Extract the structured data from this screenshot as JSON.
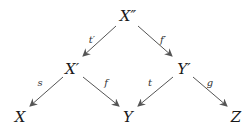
{
  "diagram": {
    "type": "commutative-diagram",
    "line_color": "#555555",
    "nodes": [
      {
        "id": "Xpp",
        "label": "X″",
        "x": 128,
        "y": 16
      },
      {
        "id": "Xp",
        "label": "X′",
        "x": 72,
        "y": 69
      },
      {
        "id": "Yp",
        "label": "Y′",
        "x": 184,
        "y": 69
      },
      {
        "id": "X",
        "label": "X",
        "x": 20,
        "y": 117
      },
      {
        "id": "Y",
        "label": "Y",
        "x": 128,
        "y": 117
      },
      {
        "id": "Z",
        "label": "Z",
        "x": 236,
        "y": 117
      }
    ],
    "edges": [
      {
        "from": "Xpp",
        "to": "Xp",
        "label": "t′",
        "lx": 92,
        "ly": 40,
        "x1": 116,
        "y1": 26,
        "x2": 83,
        "y2": 56
      },
      {
        "from": "Xpp",
        "to": "Yp",
        "label": "f′",
        "lx": 163,
        "ly": 40,
        "x1": 138,
        "y1": 26,
        "x2": 172,
        "y2": 56
      },
      {
        "from": "Xp",
        "to": "X",
        "label": "s",
        "lx": 40,
        "ly": 83,
        "x1": 63,
        "y1": 77,
        "x2": 30,
        "y2": 106
      },
      {
        "from": "Xp",
        "to": "Y",
        "label": "f",
        "lx": 106,
        "ly": 83,
        "x1": 83,
        "y1": 77,
        "x2": 119,
        "y2": 106
      },
      {
        "from": "Yp",
        "to": "Y",
        "label": "t",
        "lx": 150,
        "ly": 83,
        "x1": 173,
        "y1": 77,
        "x2": 138,
        "y2": 106
      },
      {
        "from": "Yp",
        "to": "Z",
        "label": "g",
        "lx": 210,
        "ly": 83,
        "x1": 193,
        "y1": 77,
        "x2": 227,
        "y2": 106
      }
    ]
  }
}
